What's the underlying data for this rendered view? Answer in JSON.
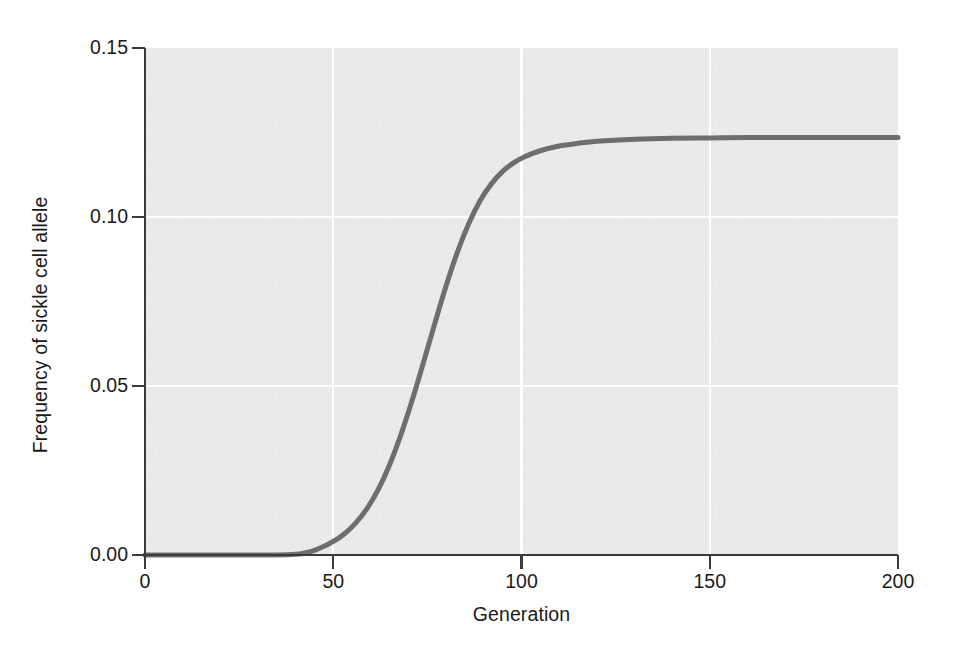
{
  "chart_data": {
    "type": "line",
    "title": "",
    "subtitle": "",
    "xlabel": "Generation",
    "ylabel": "Frequency of sickle cell allele",
    "xlim": [
      0,
      200
    ],
    "ylim": [
      0.0,
      0.15
    ],
    "xticks": [
      0,
      50,
      100,
      150,
      200
    ],
    "xtick_labels": [
      "0",
      "50",
      "100",
      "150",
      "200"
    ],
    "yticks": [
      0.0,
      0.05,
      0.1,
      0.15
    ],
    "ytick_labels": [
      "0.00",
      "0.05",
      "0.10",
      "0.15"
    ],
    "grid": true,
    "grid_color": "#ffffff",
    "panel_color": "#eaeaea",
    "legend": false,
    "legend_position": "none",
    "annotations": [],
    "series": [
      {
        "name": "Frequency of sickle cell allele",
        "color": "#6e6e6e",
        "line_width": 5,
        "x": [
          0,
          10,
          20,
          30,
          35,
          40,
          42,
          45,
          48,
          50,
          53,
          56,
          59,
          62,
          65,
          68,
          71,
          74,
          77,
          80,
          83,
          86,
          89,
          92,
          95,
          98,
          101,
          105,
          110,
          115,
          120,
          130,
          140,
          150,
          160,
          170,
          180,
          190,
          200
        ],
        "y": [
          0.0,
          0.0,
          0.0,
          0.0,
          0.0,
          0.0002,
          0.0005,
          0.0014,
          0.0028,
          0.004,
          0.0063,
          0.0095,
          0.0138,
          0.0195,
          0.0268,
          0.0357,
          0.0459,
          0.0571,
          0.0686,
          0.0797,
          0.0897,
          0.0981,
          0.1048,
          0.1098,
          0.1135,
          0.1161,
          0.1179,
          0.1196,
          0.121,
          0.1218,
          0.1224,
          0.123,
          0.1233,
          0.1234,
          0.1235,
          0.1235,
          0.1235,
          0.1235,
          0.1235
        ]
      }
    ]
  },
  "figure": {
    "background": "#ffffff",
    "axis_color": "#3a3a3a",
    "text_color": "#1a1a1a"
  }
}
